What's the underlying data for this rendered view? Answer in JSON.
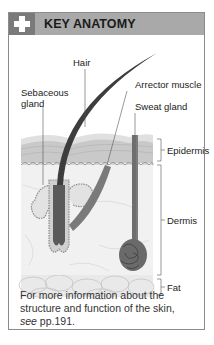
{
  "header": {
    "icon": "plus-icon",
    "title": "KEY ANATOMY",
    "colors": {
      "bar": "#a9a9a9",
      "icon_box": "#7a7a7a"
    }
  },
  "diagram": {
    "labels": {
      "hair": "Hair",
      "sebaceous_gland": "Sebaceous\ngland",
      "sebaceous_line1": "Sebaceous",
      "sebaceous_line2": "gland",
      "arrector_muscle": "Arrector muscle",
      "sweat_gland": "Sweat gland",
      "epidermis": "Epidermis",
      "dermis": "Dermis",
      "fat": "Fat"
    }
  },
  "caption": {
    "line1": "For more information about the",
    "line2": "structure and function of the skin,",
    "see": "see",
    "ref": " pp.191."
  }
}
